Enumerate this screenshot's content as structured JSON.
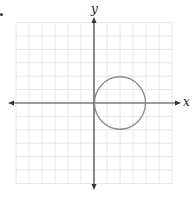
{
  "figure": {
    "question_marker": "•",
    "x_axis_label": "x",
    "y_axis_label": "y",
    "grid": {
      "x_min": -6,
      "x_max": 6,
      "y_min": -6,
      "y_max": 6,
      "step": 1
    },
    "colors": {
      "grid": "#e6e6e6",
      "axis": "#444444",
      "circle": "#8a8a8a",
      "label": "#222222"
    }
  },
  "chart_data": {
    "type": "scatter",
    "title": "",
    "xlabel": "x",
    "ylabel": "y",
    "xlim": [
      -6,
      6
    ],
    "ylim": [
      -6,
      6
    ],
    "grid": true,
    "tick_labels": false,
    "shapes": [
      {
        "kind": "circle",
        "center": [
          2,
          0
        ],
        "radius": 2
      }
    ],
    "annotations": [
      "Circle tangent to the y-axis at the origin"
    ]
  }
}
